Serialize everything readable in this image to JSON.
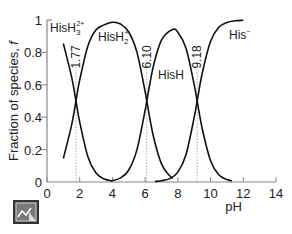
{
  "chart_data": {
    "type": "line",
    "title": "",
    "xlabel": "pH",
    "ylabel": "Fraction of species, f",
    "xlim": [
      0,
      14
    ],
    "ylim": [
      0,
      1
    ],
    "xticks": [
      "0",
      "2",
      "4",
      "6",
      "8",
      "10",
      "12",
      "14"
    ],
    "yticks": [
      "0",
      "0.2",
      "0.4",
      "0.6",
      "0.8",
      "1"
    ],
    "grid": false,
    "pKa_markers": [
      {
        "pH": 1.77,
        "label": "1.77"
      },
      {
        "pH": 6.1,
        "label": "6.10"
      },
      {
        "pH": 9.18,
        "label": "9.18"
      }
    ],
    "series": [
      {
        "name": "HisH3 2+",
        "label_main": "HisH",
        "label_sub": "3",
        "label_sup": "2+",
        "x": [
          1.0,
          1.5,
          1.77,
          2.0,
          2.5,
          3.0,
          3.5,
          4.0
        ],
        "y": [
          0.855,
          0.65,
          0.5,
          0.37,
          0.156,
          0.055,
          0.018,
          0.006
        ]
      },
      {
        "name": "HisH2 +",
        "label_main": "HisH",
        "label_sub": "2",
        "label_sup": "+",
        "x": [
          1.0,
          1.5,
          1.77,
          2.0,
          2.5,
          3.0,
          3.5,
          4.0,
          4.5,
          5.0,
          5.5,
          6.0,
          6.1,
          6.5,
          7.0,
          7.5,
          7.7
        ],
        "y": [
          0.145,
          0.35,
          0.5,
          0.63,
          0.84,
          0.94,
          0.97,
          0.986,
          0.975,
          0.926,
          0.8,
          0.557,
          0.5,
          0.284,
          0.112,
          0.038,
          0.024
        ]
      },
      {
        "name": "HisH",
        "label_main": "HisH",
        "label_sub": "",
        "label_sup": "",
        "x": [
          4.0,
          4.5,
          5.0,
          5.5,
          6.0,
          6.1,
          6.5,
          7.0,
          7.64,
          8.0,
          8.5,
          9.0,
          9.18,
          9.5,
          10.0,
          10.5,
          11.0,
          11.3
        ],
        "y": [
          0.008,
          0.025,
          0.074,
          0.2,
          0.443,
          0.5,
          0.714,
          0.876,
          0.94,
          0.925,
          0.826,
          0.6,
          0.5,
          0.324,
          0.131,
          0.045,
          0.015,
          0.007
        ]
      },
      {
        "name": "His -",
        "label_main": "His",
        "label_sub": "",
        "label_sup": "−",
        "x": [
          6.6,
          7.0,
          7.5,
          8.0,
          8.5,
          9.0,
          9.18,
          9.5,
          10.0,
          10.5,
          11.0,
          11.5,
          12.0
        ],
        "y": [
          0.003,
          0.008,
          0.021,
          0.061,
          0.17,
          0.4,
          0.5,
          0.676,
          0.869,
          0.955,
          0.985,
          0.995,
          0.998
        ]
      }
    ]
  },
  "toolbar": {
    "chart_icon_label": "chart-view"
  }
}
